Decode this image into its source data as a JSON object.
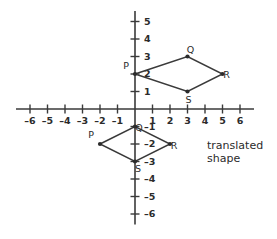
{
  "chart_data": {
    "type": "scatter",
    "title": "",
    "subtitle": "",
    "xlabel": "",
    "ylabel": "",
    "xlim": [
      -6.8,
      6.8
    ],
    "ylim": [
      -6.6,
      5.6
    ],
    "grid": false,
    "legend_position": "none",
    "x_ticks": [
      -6,
      -5,
      -4,
      -3,
      -2,
      -1,
      1,
      2,
      3,
      4,
      5,
      6
    ],
    "y_ticks": [
      5,
      4,
      3,
      2,
      1,
      -1,
      -2,
      -3,
      -4,
      -5,
      -6
    ],
    "x_tick_labels": [
      "–6",
      "–5",
      "–4",
      "–3",
      "–2",
      "–1",
      "1",
      "2",
      "3",
      "4",
      "5",
      "6"
    ],
    "y_tick_labels": [
      "5",
      "4",
      "3",
      "2",
      "1",
      "–1",
      "–2",
      "–3",
      "–4",
      "–5",
      "–6"
    ],
    "axis_color": "#3a3a3a",
    "shape_color": "#3a3a3a",
    "origin_px": {
      "x": 135,
      "y": 109
    },
    "unit_px": 17.5,
    "series": [
      {
        "name": "original shape",
        "closed": true,
        "vertices": [
          {
            "label": "P",
            "x": 0,
            "y": 2,
            "label_dx": -9,
            "label_dy": -5
          },
          {
            "label": "Q",
            "x": 3,
            "y": 3,
            "label_dx": 3,
            "label_dy": -4
          },
          {
            "label": "R",
            "x": 5,
            "y": 2,
            "label_dx": 4,
            "label_dy": 4
          },
          {
            "label": "S",
            "x": 3,
            "y": 1,
            "label_dx": 1,
            "label_dy": 11
          }
        ]
      },
      {
        "name": "translated shape",
        "closed": true,
        "vertices": [
          {
            "label": "P",
            "x": -2,
            "y": -2,
            "label_dx": -9,
            "label_dy": -6
          },
          {
            "label": "Q",
            "x": 0,
            "y": -1,
            "label_dx": 4,
            "label_dy": 4
          },
          {
            "label": "R",
            "x": 2,
            "y": -2,
            "label_dx": 4,
            "label_dy": 5
          },
          {
            "label": "S",
            "x": 0,
            "y": -3,
            "label_dx": 3,
            "label_dy": 10
          }
        ]
      }
    ]
  },
  "annotation": {
    "translated_shape_label": "translated\nshape",
    "position_px": {
      "left": 207,
      "top": 139
    }
  }
}
